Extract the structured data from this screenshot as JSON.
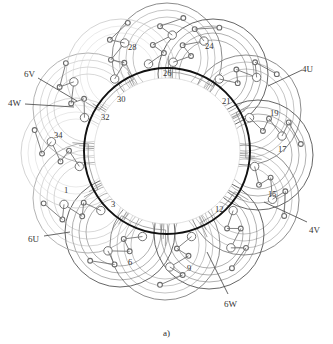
{
  "figure": {
    "caption": "a)",
    "type": "stator-winding-layout",
    "center": {
      "x": 167,
      "y": 151
    },
    "bore_radius": 83,
    "colors": {
      "bore_stroke": "#111111",
      "coil_dark": "#555555",
      "coil_mid": "#7f7f7f",
      "coil_light": "#aaaaaa",
      "coil_faint": "#cfcfcf",
      "node_stroke": "#6b6b6b",
      "label_text": "#2b2b2b",
      "background": "#ffffff"
    }
  },
  "slot_labels": [
    {
      "id": "slot-1",
      "text": "1",
      "x": 64,
      "y": 186,
      "anchor_x": 77,
      "anchor_y": 193
    },
    {
      "id": "slot-3",
      "text": "3",
      "x": 111,
      "y": 200,
      "anchor_x": 111,
      "anchor_y": 200
    },
    {
      "id": "slot-6",
      "text": "6",
      "x": 128,
      "y": 258,
      "anchor_x": 136,
      "anchor_y": 256
    },
    {
      "id": "slot-9",
      "text": "9",
      "x": 187,
      "y": 264,
      "anchor_x": 187,
      "anchor_y": 258
    },
    {
      "id": "slot-12",
      "text": "12",
      "x": 215,
      "y": 205,
      "anchor_x": 215,
      "anchor_y": 205
    },
    {
      "id": "slot-15",
      "text": "15",
      "x": 268,
      "y": 190,
      "anchor_x": 262,
      "anchor_y": 190
    },
    {
      "id": "slot-17",
      "text": "17",
      "x": 278,
      "y": 145,
      "anchor_x": 272,
      "anchor_y": 147
    },
    {
      "id": "slot-19",
      "text": "19",
      "x": 270,
      "y": 109,
      "anchor_x": 264,
      "anchor_y": 112
    },
    {
      "id": "slot-21",
      "text": "21",
      "x": 222,
      "y": 97,
      "anchor_x": 222,
      "anchor_y": 97
    },
    {
      "id": "slot-24",
      "text": "24",
      "x": 205,
      "y": 42,
      "anchor_x": 205,
      "anchor_y": 48
    },
    {
      "id": "slot-26",
      "text": "26",
      "x": 163,
      "y": 69,
      "anchor_x": 163,
      "anchor_y": 72
    },
    {
      "id": "slot-28",
      "text": "28",
      "x": 128,
      "y": 43,
      "anchor_x": 133,
      "anchor_y": 50
    },
    {
      "id": "slot-30",
      "text": "30",
      "x": 117,
      "y": 95,
      "anchor_x": 117,
      "anchor_y": 95
    },
    {
      "id": "slot-32",
      "text": "32",
      "x": 101,
      "y": 113,
      "anchor_x": 101,
      "anchor_y": 113
    },
    {
      "id": "slot-34",
      "text": "34",
      "x": 54,
      "y": 131,
      "anchor_x": 60,
      "anchor_y": 131
    }
  ],
  "terminal_labels": [
    {
      "id": "terminal-6V",
      "text": "6V",
      "x": 24,
      "y": 70,
      "line": {
        "x1": 38,
        "y1": 78,
        "x2": 77,
        "y2": 101
      }
    },
    {
      "id": "terminal-4W",
      "text": "4W",
      "x": 8,
      "y": 99,
      "line": {
        "x1": 25,
        "y1": 104,
        "x2": 74,
        "y2": 107
      }
    },
    {
      "id": "terminal-6U",
      "text": "6U",
      "x": 28,
      "y": 235,
      "line": {
        "x1": 44,
        "y1": 236,
        "x2": 70,
        "y2": 232
      }
    },
    {
      "id": "terminal-6W",
      "text": "6W",
      "x": 224,
      "y": 300,
      "line": {
        "x1": 228,
        "y1": 294,
        "x2": 207,
        "y2": 252
      }
    },
    {
      "id": "terminal-4V",
      "text": "4V",
      "x": 309,
      "y": 226,
      "line": {
        "x1": 307,
        "y1": 222,
        "x2": 264,
        "y2": 202
      }
    },
    {
      "id": "terminal-4U",
      "text": "4U",
      "x": 302,
      "y": 65,
      "line": {
        "x1": 302,
        "y1": 70,
        "x2": 268,
        "y2": 86
      }
    }
  ],
  "coil_groups": [
    {
      "id": "coil-0",
      "cx": 167,
      "cy": 58,
      "r": 55,
      "tone": "coil_mid"
    },
    {
      "id": "coil-1",
      "cx": 213,
      "cy": 74,
      "r": 55,
      "tone": "coil_dark"
    },
    {
      "id": "coil-2",
      "cx": 246,
      "cy": 110,
      "r": 55,
      "tone": "coil_mid"
    },
    {
      "id": "coil-3",
      "cx": 258,
      "cy": 155,
      "r": 55,
      "tone": "coil_dark"
    },
    {
      "id": "coil-4",
      "cx": 244,
      "cy": 200,
      "r": 55,
      "tone": "coil_mid"
    },
    {
      "id": "coil-5",
      "cx": 209,
      "cy": 234,
      "r": 55,
      "tone": "coil_dark"
    },
    {
      "id": "coil-6",
      "cx": 165,
      "cy": 245,
      "r": 55,
      "tone": "coil_mid"
    },
    {
      "id": "coil-7",
      "cx": 120,
      "cy": 232,
      "r": 55,
      "tone": "coil_dark"
    },
    {
      "id": "coil-8",
      "cx": 88,
      "cy": 198,
      "r": 55,
      "tone": "coil_light"
    },
    {
      "id": "coil-9",
      "cx": 76,
      "cy": 153,
      "r": 55,
      "tone": "coil_faint"
    },
    {
      "id": "coil-10",
      "cx": 88,
      "cy": 108,
      "r": 55,
      "tone": "coil_light"
    },
    {
      "id": "coil-11",
      "cx": 121,
      "cy": 74,
      "r": 55,
      "tone": "coil_faint"
    }
  ]
}
